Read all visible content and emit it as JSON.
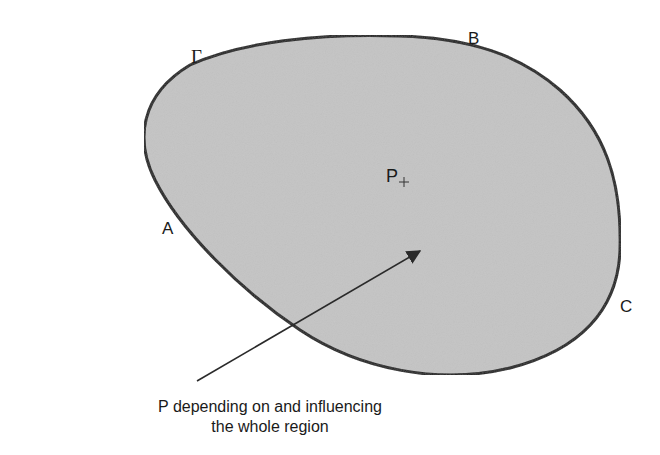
{
  "figure": {
    "region_fill": "#c4c4c4",
    "boundary_color": "#222222",
    "arrow_color": "#2a2a2a",
    "labels": {
      "gamma": "Γ",
      "b": "B",
      "a": "A",
      "c": "C",
      "p": "P",
      "p_marker": "+"
    },
    "caption": {
      "line1": "P depending on and influencing",
      "line2": "the whole region"
    }
  }
}
